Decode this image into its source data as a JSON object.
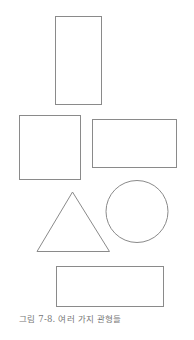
{
  "figure": {
    "caption": "그림 7-8. 여러 가지 관형들",
    "stroke_color": "#888888",
    "shapes": [
      {
        "type": "rectangle",
        "name": "tall-rectangle"
      },
      {
        "type": "rectangle",
        "name": "square"
      },
      {
        "type": "rectangle",
        "name": "wide-rectangle"
      },
      {
        "type": "triangle",
        "name": "triangle"
      },
      {
        "type": "circle",
        "name": "circle"
      },
      {
        "type": "rectangle",
        "name": "bottom-rectangle"
      }
    ]
  }
}
